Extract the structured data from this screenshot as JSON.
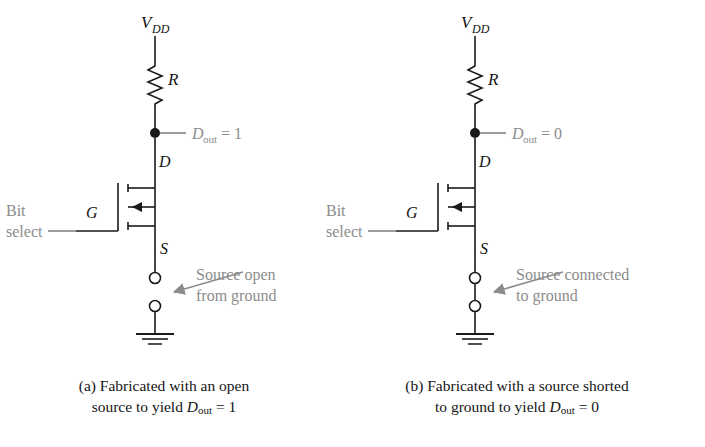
{
  "figure": {
    "type": "circuit-diagram",
    "background_color": "#ffffff",
    "wire_color": "#1a1a1a",
    "annotation_color": "#8c8c8c",
    "label_color": "#141414"
  },
  "circuits": [
    {
      "id": "a",
      "supply_label": "V",
      "supply_sub": "DD",
      "resistor_label": "R",
      "output_label": "D",
      "output_sub": "out",
      "output_value": "= 1",
      "drain_label": "D",
      "gate_label": "G",
      "source_label": "S",
      "input_label_line1": "Bit",
      "input_label_line2": "select",
      "annotation_line1": "Source open",
      "annotation_line2": "from ground",
      "source_state": "open",
      "ground": true
    },
    {
      "id": "b",
      "supply_label": "V",
      "supply_sub": "DD",
      "resistor_label": "R",
      "output_label": "D",
      "output_sub": "out",
      "output_value": "= 0",
      "drain_label": "D",
      "gate_label": "G",
      "source_label": "S",
      "input_label_line1": "Bit",
      "input_label_line2": "select",
      "annotation_line1": "Source connected",
      "annotation_line2": "to ground",
      "source_state": "shorted",
      "ground": true
    }
  ],
  "captions": {
    "a": {
      "prefix": "(a) Fabricated with an open",
      "line2_pre": "source to yield ",
      "line2_var": "D",
      "line2_sub": "out",
      "line2_post": " = 1"
    },
    "b": {
      "prefix": "(b) Fabricated with a source shorted",
      "line2_pre": "to ground to yield ",
      "line2_var": "D",
      "line2_sub": "out",
      "line2_post": " = 0"
    }
  }
}
